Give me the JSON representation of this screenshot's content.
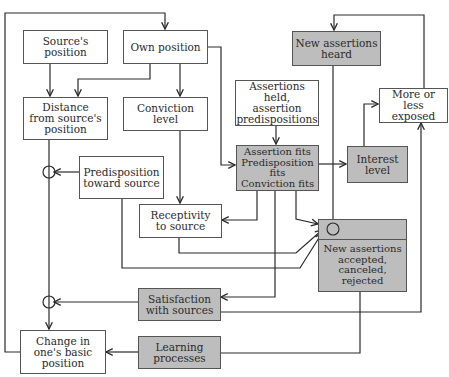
{
  "diagram": {
    "type": "flow-model",
    "colors": {
      "box_white": "#ffffff",
      "box_gray": "#bdbdbd",
      "line": "#2a2a2a"
    },
    "nodes": {
      "sources_position": {
        "label": "Source's position",
        "shaded": false
      },
      "own_position": {
        "label": "Own position",
        "shaded": false
      },
      "distance": {
        "label": "Distance\nfrom source's\nposition",
        "shaded": false
      },
      "conviction_level": {
        "label": "Conviction\nlevel",
        "shaded": false
      },
      "predisposition_source": {
        "label": "Predisposition\ntoward source",
        "shaded": false
      },
      "assertions_held": {
        "label": "Assertions held,\nassertion\npredispositions",
        "shaded": false
      },
      "new_assertions_heard": {
        "label": "New assertions\nheard",
        "shaded": true
      },
      "more_less_exposed": {
        "label": "More or less\nexposed",
        "shaded": false
      },
      "fits": {
        "label": "Assertion fits\nPredisposition fits\nConviction fits",
        "shaded": true
      },
      "interest_level": {
        "label": "Interest\nlevel",
        "shaded": true
      },
      "receptivity": {
        "label": "Receptivity\nto source",
        "shaded": false
      },
      "new_assertions_accepted": {
        "label": "New assertions\naccepted,\ncanceled,\nrejected",
        "shaded": true
      },
      "satisfaction": {
        "label": "Satisfaction\nwith sources",
        "shaded": true
      },
      "change_position": {
        "label": "Change in\none's basic\nposition",
        "shaded": false
      },
      "learning": {
        "label": "Learning\nprocesses",
        "shaded": true
      }
    },
    "edges": [
      [
        "change_position",
        "own_position"
      ],
      [
        "sources_position",
        "distance"
      ],
      [
        "own_position",
        "distance"
      ],
      [
        "own_position",
        "conviction_level"
      ],
      [
        "own_position",
        "fits"
      ],
      [
        "distance",
        "change_position"
      ],
      [
        "predisposition_source",
        "distance-change junction"
      ],
      [
        "conviction_level",
        "receptivity"
      ],
      [
        "assertions_held",
        "fits"
      ],
      [
        "fits",
        "interest_level"
      ],
      [
        "fits",
        "receptivity"
      ],
      [
        "fits",
        "satisfaction"
      ],
      [
        "fits",
        "new_assertions_accepted"
      ],
      [
        "interest_level",
        "more_less_exposed"
      ],
      [
        "more_less_exposed",
        "new_assertions_heard"
      ],
      [
        "new_assertions_heard",
        "new_assertions_accepted"
      ],
      [
        "receptivity",
        "new_assertions_accepted"
      ],
      [
        "predisposition_source",
        "new_assertions_accepted"
      ],
      [
        "satisfaction",
        "distance-change junction"
      ],
      [
        "satisfaction",
        "more_less_exposed"
      ],
      [
        "new_assertions_accepted",
        "learning"
      ],
      [
        "learning",
        "change_position"
      ]
    ]
  }
}
